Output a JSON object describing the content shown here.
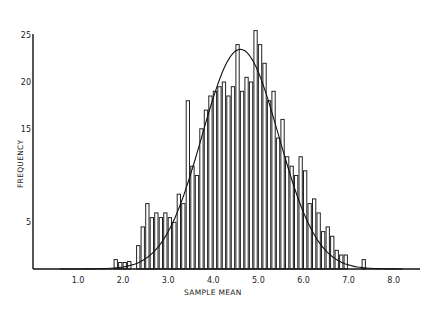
{
  "chart_data": {
    "type": "bar",
    "subtype": "histogram_with_normal_curve",
    "title": "",
    "xlabel": "SAMPLE MEAN",
    "ylabel": "FREQUENCY",
    "xlim": [
      0.0,
      8.5
    ],
    "ylim": [
      0,
      25
    ],
    "x_ticks": [
      "1.0",
      "2.0",
      "3.0",
      "4.0",
      "5.0",
      "6.0",
      "7.0",
      "8.0"
    ],
    "x_tick_values": [
      1.0,
      2.0,
      3.0,
      4.0,
      5.0,
      6.0,
      7.0,
      8.0
    ],
    "y_ticks": [
      "5",
      "15",
      "20",
      "25"
    ],
    "y_tick_values": [
      5,
      15,
      20,
      25
    ],
    "grid": false,
    "legend": null,
    "bin_width": 0.1,
    "bins": [
      {
        "x": 1.85,
        "y": 1
      },
      {
        "x": 1.95,
        "y": 0.7
      },
      {
        "x": 2.05,
        "y": 0.7
      },
      {
        "x": 2.15,
        "y": 0.8
      },
      {
        "x": 2.35,
        "y": 2.5
      },
      {
        "x": 2.45,
        "y": 4.5
      },
      {
        "x": 2.55,
        "y": 7.0
      },
      {
        "x": 2.65,
        "y": 5.5
      },
      {
        "x": 2.75,
        "y": 6.0
      },
      {
        "x": 2.85,
        "y": 5.5
      },
      {
        "x": 2.95,
        "y": 6.0
      },
      {
        "x": 3.05,
        "y": 5.5
      },
      {
        "x": 3.15,
        "y": 5.0
      },
      {
        "x": 3.25,
        "y": 8.0
      },
      {
        "x": 3.35,
        "y": 7.0
      },
      {
        "x": 3.45,
        "y": 18.0
      },
      {
        "x": 3.55,
        "y": 11.0
      },
      {
        "x": 3.65,
        "y": 10.0
      },
      {
        "x": 3.75,
        "y": 15.0
      },
      {
        "x": 3.85,
        "y": 17.0
      },
      {
        "x": 3.95,
        "y": 18.5
      },
      {
        "x": 4.05,
        "y": 19.0
      },
      {
        "x": 4.15,
        "y": 19.5
      },
      {
        "x": 4.25,
        "y": 20.0
      },
      {
        "x": 4.35,
        "y": 18.5
      },
      {
        "x": 4.45,
        "y": 19.5
      },
      {
        "x": 4.55,
        "y": 24.0
      },
      {
        "x": 4.65,
        "y": 19.0
      },
      {
        "x": 4.75,
        "y": 20.5
      },
      {
        "x": 4.85,
        "y": 20.0
      },
      {
        "x": 4.95,
        "y": 25.5
      },
      {
        "x": 5.05,
        "y": 24.0
      },
      {
        "x": 5.15,
        "y": 22.0
      },
      {
        "x": 5.25,
        "y": 18.0
      },
      {
        "x": 5.35,
        "y": 19.0
      },
      {
        "x": 5.45,
        "y": 14.0
      },
      {
        "x": 5.55,
        "y": 16.0
      },
      {
        "x": 5.65,
        "y": 12.0
      },
      {
        "x": 5.75,
        "y": 11.0
      },
      {
        "x": 5.85,
        "y": 10.0
      },
      {
        "x": 5.95,
        "y": 12.0
      },
      {
        "x": 6.05,
        "y": 10.5
      },
      {
        "x": 6.15,
        "y": 7.0
      },
      {
        "x": 6.25,
        "y": 7.5
      },
      {
        "x": 6.35,
        "y": 6.0
      },
      {
        "x": 6.45,
        "y": 4.0
      },
      {
        "x": 6.55,
        "y": 4.5
      },
      {
        "x": 6.65,
        "y": 3.5
      },
      {
        "x": 6.75,
        "y": 2.0
      },
      {
        "x": 6.85,
        "y": 1.5
      },
      {
        "x": 6.95,
        "y": 1.5
      },
      {
        "x": 7.35,
        "y": 1.0
      }
    ],
    "fitted_curve": {
      "type": "normal",
      "mean": 4.6,
      "sd": 0.85,
      "peak_y": 23.5
    }
  }
}
